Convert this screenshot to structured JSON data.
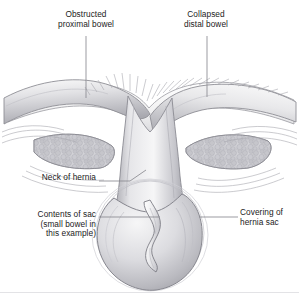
{
  "figure": {
    "style": "grayscale medical line drawing",
    "width": 299,
    "height": 299,
    "background": "#ffffff"
  },
  "labels": {
    "obstructed_proximal_bowel": "Obstructed\nproximal bowel",
    "collapsed_distal_bowel": "Collapsed\ndistal bowel",
    "neck_of_hernia": "Neck of hernia",
    "contents_of_sac": "Contents of sac\n(small bowel in\nthis example)",
    "covering_of_hernia_sac": "Covering of\nhernia sac"
  },
  "colors": {
    "text": "#1b1b1b",
    "leader_line": "#8a8a90",
    "outline": "#6f6f76",
    "outline_light": "#b4b4ba",
    "fat_fill": "#c9c9ce",
    "fat_lobule": "#b0b0b6",
    "bowel_light": "#f2f2f3",
    "bowel_mid": "#d2d2d6",
    "bowel_dark": "#9b9ba1",
    "sac_shade": "#bcbcc2",
    "baseline": "#e3e3e6"
  },
  "anatomy": {
    "parts": [
      {
        "name": "obstructed-proximal-bowel",
        "side": "left",
        "description": "dilated smooth bowel loop upper left"
      },
      {
        "name": "collapsed-distal-bowel",
        "side": "right",
        "description": "narrow collapsed bowel loop upper right"
      },
      {
        "name": "serosal-fringe",
        "description": "hatched villous fringe along upper peritoneal surface"
      },
      {
        "name": "fat-pad-left",
        "side": "left",
        "description": "stippled lobular fat layer in abdominal wall"
      },
      {
        "name": "fat-pad-right",
        "side": "right",
        "description": "stippled lobular fat layer in abdominal wall"
      },
      {
        "name": "hernia-neck",
        "description": "narrowed defect where bowel passes through abdominal wall"
      },
      {
        "name": "hernia-sac",
        "description": "oval teardrop sac with concentric coverings"
      },
      {
        "name": "sac-contents-bowel",
        "description": "twisted small bowel loop inside the sac"
      }
    ]
  },
  "leaders": [
    {
      "name": "leader-obstructed",
      "from": [
        86,
        36
      ],
      "to": [
        86,
        98
      ]
    },
    {
      "name": "leader-collapsed",
      "from": [
        207,
        36
      ],
      "to": [
        207,
        97
      ]
    },
    {
      "name": "leader-neck",
      "from": [
        99,
        181
      ],
      "to": [
        139,
        181
      ]
    },
    {
      "name": "leader-contents",
      "from": [
        99,
        217
      ],
      "to": [
        160,
        217
      ]
    },
    {
      "name": "leader-covering",
      "from": [
        199,
        217
      ],
      "to": [
        238,
        217
      ]
    }
  ]
}
